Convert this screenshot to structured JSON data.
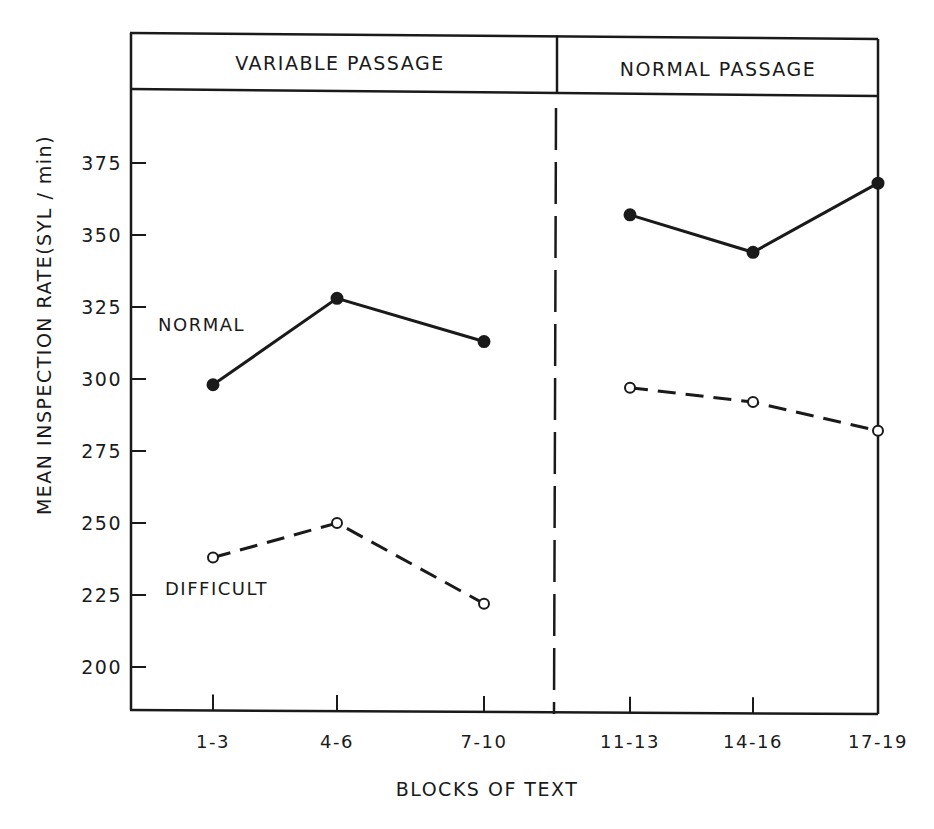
{
  "chart_data": {
    "type": "line",
    "title": "",
    "panels": [
      {
        "label": "VARIABLE PASSAGE",
        "categories": [
          "1-3",
          "4-6",
          "7-10"
        ]
      },
      {
        "label": "NORMAL PASSAGE",
        "categories": [
          "11-13",
          "14-16",
          "17-19"
        ]
      }
    ],
    "categories": [
      "1-3",
      "4-6",
      "7-10",
      "11-13",
      "14-16",
      "17-19"
    ],
    "series": [
      {
        "name": "NORMAL",
        "style": "solid",
        "marker": "filled-circle",
        "values": [
          298,
          328,
          313,
          357,
          344,
          368
        ]
      },
      {
        "name": "DIFFICULT",
        "style": "dashed",
        "marker": "open-circle",
        "values": [
          238,
          250,
          222,
          297,
          292,
          282
        ]
      }
    ],
    "xlabel": "BLOCKS OF TEXT",
    "ylabel": "MEAN INSPECTION RATE (SYL / min)",
    "yticks": [
      200,
      225,
      250,
      275,
      300,
      325,
      350,
      375
    ],
    "ylim": [
      187,
      396
    ],
    "grid": false,
    "legend": "inline labels",
    "divider": "dashed vertical line between 7-10 and 11-13"
  },
  "labels": {
    "panel_left": "VARIABLE PASSAGE",
    "panel_right": "NORMAL PASSAGE",
    "series_normal": "NORMAL",
    "series_difficult": "DIFFICULT",
    "xlabel": "BLOCKS OF TEXT",
    "ylabel": "MEAN INSPECTION RATE(SYL / min)"
  }
}
